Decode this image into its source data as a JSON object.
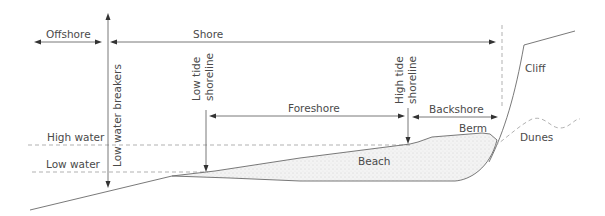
{
  "diagram": {
    "zones": {
      "offshore": "Offshore",
      "shore": "Shore",
      "foreshore": "Foreshore",
      "backshore": "Backshore"
    },
    "markers": {
      "low_water_breakers": "Low water breakers",
      "low_tide_shoreline_line1": "Low tide",
      "low_tide_shoreline_line2": "shoreline",
      "high_tide_shoreline_line1": "High tide",
      "high_tide_shoreline_line2": "shoreline"
    },
    "levels": {
      "high_water": "High water",
      "low_water": "Low water"
    },
    "features": {
      "beach": "Beach",
      "berm": "Berm",
      "cliff": "Cliff",
      "dunes": "Dunes"
    },
    "colors": {
      "line": "#6a6a6a",
      "dashed": "#a8a8a8",
      "text": "#4a4a4a",
      "sand": "#ececec"
    }
  }
}
